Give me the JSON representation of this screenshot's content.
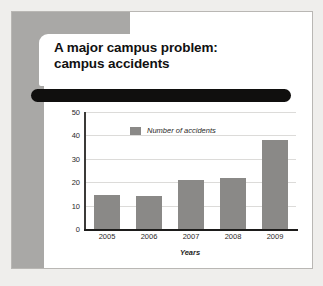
{
  "slide": {
    "title": "A major campus problem:\ncampus accidents",
    "redaction_bar": "redacted-text-bar",
    "accent_gray": "#a9a8a6",
    "bar_color": "#8a8987",
    "card_background": "#ffffff",
    "page_background": "#efeeec"
  },
  "chart_data": {
    "type": "bar",
    "title": "",
    "categories": [
      "2005",
      "2006",
      "2007",
      "2008",
      "2009"
    ],
    "values": [
      14.5,
      14,
      21,
      22,
      38
    ],
    "series": [
      {
        "name": "Number of accidents",
        "values": [
          14.5,
          14,
          21,
          22,
          38
        ]
      }
    ],
    "xlabel": "Years",
    "ylabel": "",
    "ylim": [
      0,
      50
    ],
    "yticks": [
      0,
      10,
      20,
      30,
      40,
      50
    ],
    "ytick_labels": [
      "0",
      "10",
      "20",
      "30",
      "40",
      "50"
    ],
    "grid": true,
    "legend": {
      "position": "top-left-inside",
      "entries": [
        "Number of accidents"
      ]
    },
    "bar_color": "#8a8987"
  }
}
